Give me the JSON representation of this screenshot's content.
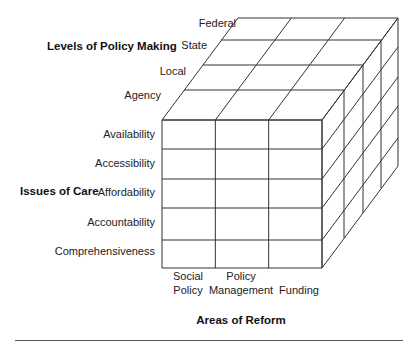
{
  "diagram": {
    "title_levels": "Levels of Policy Making",
    "title_issues": "Issues of Care",
    "title_areas": "Areas of Reform",
    "levels": [
      "Federal",
      "State",
      "Local",
      "Agency"
    ],
    "issues": [
      "Availability",
      "Accessibility",
      "Affordability",
      "Accountability",
      "Comprehensiveness"
    ],
    "areas": [
      {
        "line1": "Social",
        "line2": "Policy"
      },
      {
        "line1": "Policy",
        "line2": "Management"
      },
      {
        "line1": "",
        "line2": "Funding"
      }
    ],
    "colors": {
      "line": "#333333",
      "text": "#222222",
      "background": "#ffffff"
    }
  }
}
